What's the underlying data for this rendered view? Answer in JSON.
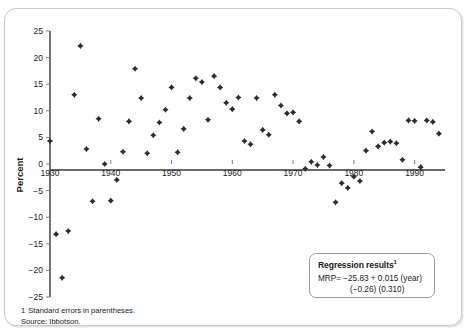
{
  "chart_data": {
    "type": "scatter",
    "title": "",
    "xlabel": "",
    "ylabel": "Percent",
    "xlim": [
      1930,
      1995
    ],
    "ylim": [
      -25,
      25
    ],
    "grid": false,
    "legend": null,
    "xticks": [
      1930,
      1940,
      1950,
      1960,
      1970,
      1980,
      1990
    ],
    "xtick_labels": [
      "1930",
      "1940",
      "1950",
      "1960",
      "1970",
      "1980",
      "1990"
    ],
    "yticks": [
      25,
      20,
      15,
      10,
      5,
      0,
      -5,
      -10,
      -15,
      -20,
      -25
    ],
    "ytick_labels": [
      "25",
      "20",
      "15",
      "10",
      "5",
      "0",
      "−5",
      "−10",
      "−15",
      "−20",
      "−25"
    ],
    "marker": "diamond",
    "marker_color": "#2b2b33",
    "series": [
      {
        "name": "Market risk premium",
        "x": [
          1930,
          1931,
          1932,
          1933,
          1934,
          1935,
          1936,
          1937,
          1938,
          1939,
          1940,
          1941,
          1942,
          1943,
          1944,
          1945,
          1946,
          1947,
          1948,
          1949,
          1950,
          1951,
          1952,
          1953,
          1954,
          1955,
          1956,
          1957,
          1958,
          1959,
          1960,
          1961,
          1962,
          1963,
          1964,
          1965,
          1966,
          1967,
          1968,
          1969,
          1970,
          1971,
          1972,
          1973,
          1974,
          1975,
          1976,
          1977,
          1978,
          1979,
          1980,
          1981,
          1982,
          1983,
          1984,
          1985,
          1986,
          1987,
          1988,
          1989,
          1990,
          1991,
          1992,
          1993,
          1994
        ],
        "y": [
          4.3,
          -13.2,
          -21.4,
          -12.6,
          13.0,
          22.2,
          2.8,
          -7.0,
          8.5,
          0.0,
          -6.9,
          -3.0,
          2.3,
          8.0,
          17.9,
          12.4,
          2.0,
          5.4,
          7.8,
          10.2,
          14.4,
          2.2,
          6.6,
          12.4,
          16.1,
          15.4,
          8.3,
          16.5,
          14.4,
          11.5,
          10.3,
          12.5,
          4.3,
          3.7,
          12.4,
          6.4,
          5.5,
          13.0,
          11.0,
          9.5,
          9.7,
          8.0,
          -0.9,
          0.4,
          -0.2,
          1.3,
          -0.3,
          -7.2,
          -3.6,
          -4.5,
          -2.4,
          -3.2,
          2.5,
          6.1,
          3.3,
          4.0,
          4.2,
          3.9,
          0.8,
          8.2,
          8.1,
          -0.6,
          8.2,
          7.9,
          5.7
        ],
        "marker": "diamond",
        "color": "#2b2b33"
      }
    ],
    "annotations": [
      {
        "name": "regression-results",
        "title": "Regression results",
        "title_superscript": "1",
        "equation": "MRP= −25.83 + 0.015 (year)",
        "standard_errors": "(−0.26)   (0.310)"
      }
    ]
  },
  "axes": {
    "y_title": "Percent"
  },
  "footnotes": {
    "note_number": "1",
    "note_text": "Standard errors in parentheses.",
    "source_label": "Source: Ibbotson."
  },
  "regression_box": {
    "title": "Regression results",
    "superscript": "1",
    "equation": "MRP= −25.83 + 0.015 (year)",
    "standard_errors": "(−0.26)   (0.310)"
  }
}
